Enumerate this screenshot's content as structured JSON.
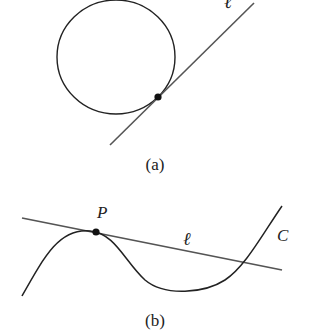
{
  "figure_a": {
    "caption": "(a)",
    "line_label": "ℓ",
    "description": "Circle with tangent line ℓ touching at a single point"
  },
  "figure_b": {
    "caption": "(b)",
    "point_label": "P",
    "line_label": "ℓ",
    "curve_label": "C",
    "description": "Curve C with tangent line ℓ at point P, line crosses curve elsewhere"
  },
  "colors": {
    "stroke": "#222222",
    "line": "#555555",
    "background": "#ffffff"
  }
}
